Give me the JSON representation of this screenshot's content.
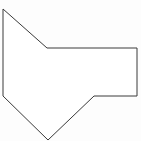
{
  "canvas": {
    "width": 141,
    "height": 141,
    "background_color": "#fdfdfd",
    "title": "Polygon Shape"
  },
  "figure": {
    "name": "irregular-heptagon-outline",
    "type": "polygon",
    "vertex_count": 7,
    "closed": true,
    "fill_color": "#ffffff",
    "stroke_color": "#3a3a3a",
    "stroke_width": 1,
    "points": "3,9 47,48 137,48 137,96 94,96 48,140 3,96",
    "vertices": [
      {
        "label": "top-left-apex",
        "x": 3,
        "y": 9
      },
      {
        "label": "upper-notch",
        "x": 47,
        "y": 48
      },
      {
        "label": "top-right",
        "x": 137,
        "y": 48
      },
      {
        "label": "bottom-right",
        "x": 137,
        "y": 96
      },
      {
        "label": "lower-notch",
        "x": 94,
        "y": 96
      },
      {
        "label": "bottom-apex",
        "x": 48,
        "y": 140
      },
      {
        "label": "bottom-left",
        "x": 3,
        "y": 96
      }
    ],
    "edges": [
      {
        "label": "left-upper-diagonal",
        "from": "top-left-apex",
        "to": "upper-notch"
      },
      {
        "label": "top-horizontal",
        "from": "upper-notch",
        "to": "top-right"
      },
      {
        "label": "right-vertical",
        "from": "top-right",
        "to": "bottom-right"
      },
      {
        "label": "bottom-horizontal",
        "from": "bottom-right",
        "to": "lower-notch"
      },
      {
        "label": "lower-right-diagonal",
        "from": "lower-notch",
        "to": "bottom-apex"
      },
      {
        "label": "lower-left-diagonal",
        "from": "bottom-apex",
        "to": "bottom-left"
      },
      {
        "label": "left-vertical",
        "from": "bottom-left",
        "to": "top-left-apex"
      }
    ]
  }
}
